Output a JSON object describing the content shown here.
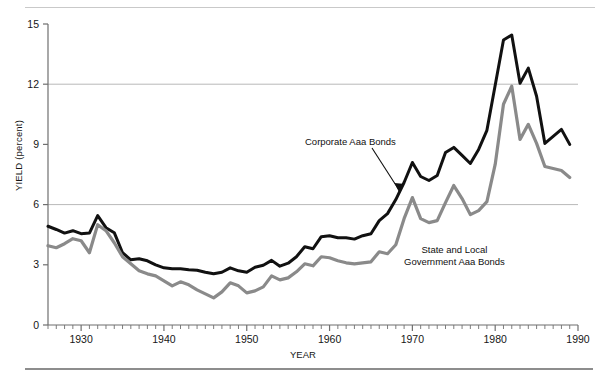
{
  "figure": {
    "title": "",
    "ylabel": "YIELD (percent)",
    "xlabel": "YEAR"
  },
  "annotations": {
    "corporate": "Corporate Aaa Bonds",
    "municipal_line1": "State and Local",
    "municipal_line2": "Government Aaa Bonds"
  },
  "colors": {
    "corporate": "#111111",
    "municipal": "#8a8a8a",
    "gridline": "#b9b9b9",
    "axis": "#6f6f6f",
    "top_rule": "#c9c9c9",
    "bottom_rule": "#8d8d8d"
  },
  "chart_data": {
    "type": "line",
    "title": "",
    "xlabel": "YEAR",
    "ylabel": "YIELD (percent)",
    "xlim": [
      1926,
      1990
    ],
    "ylim": [
      0,
      15
    ],
    "yticks": [
      0,
      3,
      6,
      9,
      12,
      15
    ],
    "ytick_labels": [
      "0",
      "3",
      "6",
      "9",
      "12",
      "15"
    ],
    "xticks": [
      1930,
      1940,
      1950,
      1960,
      1970,
      1980,
      1990
    ],
    "xtick_labels": [
      "1930",
      "1940",
      "1950",
      "1960",
      "1970",
      "1980",
      "1990"
    ],
    "minor_xtick_interval": 1,
    "gridlines": {
      "horizontal_at": [
        6,
        12
      ],
      "vertical": false
    },
    "legend_position": "inline-annotations",
    "x": [
      1926,
      1927,
      1928,
      1929,
      1930,
      1931,
      1932,
      1933,
      1934,
      1935,
      1936,
      1937,
      1938,
      1939,
      1940,
      1941,
      1942,
      1943,
      1944,
      1945,
      1946,
      1947,
      1948,
      1949,
      1950,
      1951,
      1952,
      1953,
      1954,
      1955,
      1956,
      1957,
      1958,
      1959,
      1960,
      1961,
      1962,
      1963,
      1964,
      1965,
      1966,
      1967,
      1968,
      1969,
      1970,
      1971,
      1972,
      1973,
      1974,
      1975,
      1976,
      1977,
      1978,
      1979,
      1980,
      1981,
      1982,
      1983,
      1984,
      1985,
      1986,
      1987,
      1988,
      1989
    ],
    "series": [
      {
        "name": "Corporate Aaa Bonds",
        "color": "#111111",
        "values": [
          4.92,
          4.76,
          4.58,
          4.7,
          4.55,
          4.58,
          5.45,
          4.85,
          4.6,
          3.6,
          3.25,
          3.3,
          3.2,
          3.0,
          2.85,
          2.8,
          2.8,
          2.75,
          2.73,
          2.63,
          2.55,
          2.63,
          2.85,
          2.7,
          2.63,
          2.88,
          2.98,
          3.22,
          2.93,
          3.08,
          3.4,
          3.9,
          3.8,
          4.4,
          4.45,
          4.35,
          4.35,
          4.28,
          4.45,
          4.55,
          5.2,
          5.55,
          6.25,
          7.1,
          8.1,
          7.4,
          7.2,
          7.45,
          8.6,
          8.85,
          8.45,
          8.05,
          8.75,
          9.7,
          11.95,
          14.2,
          14.45,
          12.05,
          12.8,
          11.4,
          9.05,
          9.4,
          9.75,
          9.0
        ],
        "linewidth": 3.0
      },
      {
        "name": "State and Local Government Aaa Bonds",
        "color": "#8a8a8a",
        "values": [
          3.95,
          3.85,
          4.05,
          4.3,
          4.2,
          3.6,
          5.0,
          4.7,
          4.1,
          3.4,
          3.05,
          2.7,
          2.55,
          2.45,
          2.2,
          1.95,
          2.15,
          2.0,
          1.75,
          1.55,
          1.35,
          1.65,
          2.1,
          1.95,
          1.6,
          1.7,
          1.9,
          2.45,
          2.25,
          2.35,
          2.65,
          3.05,
          2.95,
          3.4,
          3.35,
          3.2,
          3.1,
          3.05,
          3.1,
          3.15,
          3.65,
          3.55,
          4.0,
          5.3,
          6.35,
          5.3,
          5.1,
          5.2,
          6.1,
          6.95,
          6.3,
          5.5,
          5.7,
          6.15,
          8.0,
          11.0,
          11.9,
          9.25,
          10.0,
          9.05,
          7.9,
          7.8,
          7.7,
          7.35
        ],
        "linewidth": 3.2
      }
    ]
  }
}
